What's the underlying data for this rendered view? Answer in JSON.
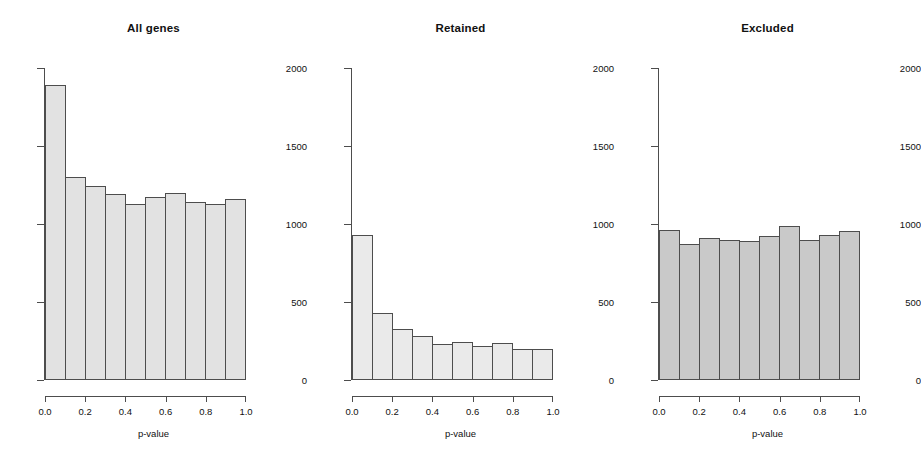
{
  "figure": {
    "background_color": "#ffffff",
    "panel_count": 3,
    "axis_color": "#4d4d4d",
    "text_color": "#111111"
  },
  "chart_data": [
    {
      "type": "bar",
      "title": "All genes",
      "xlabel": "p-value",
      "ylabel": "",
      "xlim": [
        0.0,
        1.0
      ],
      "ylim": [
        0,
        2000
      ],
      "grid": false,
      "legend": "none",
      "bin_width": 0.1,
      "bin_edges": [
        0.0,
        0.1,
        0.2,
        0.3,
        0.4,
        0.5,
        0.6,
        0.7,
        0.8,
        0.9,
        1.0
      ],
      "categories": [
        "0.0-0.1",
        "0.1-0.2",
        "0.2-0.3",
        "0.3-0.4",
        "0.4-0.5",
        "0.5-0.6",
        "0.6-0.7",
        "0.7-0.8",
        "0.8-0.9",
        "0.9-1.0"
      ],
      "values": [
        1890,
        1300,
        1245,
        1190,
        1130,
        1170,
        1200,
        1140,
        1130,
        1160
      ],
      "xticks": [
        "0.0",
        "0.2",
        "0.4",
        "0.6",
        "0.8",
        "1.0"
      ],
      "xtick_values": [
        0.0,
        0.2,
        0.4,
        0.6,
        0.8,
        1.0
      ],
      "yticks": [
        "0",
        "500",
        "1000",
        "1500",
        "2000"
      ],
      "ytick_values": [
        0,
        500,
        1000,
        1500,
        2000
      ],
      "bar_fill": "#e2e2e2",
      "bar_edge": "#4d4d4d"
    },
    {
      "type": "bar",
      "title": "Retained",
      "xlabel": "p-value",
      "ylabel": "",
      "xlim": [
        0.0,
        1.0
      ],
      "ylim": [
        0,
        2000
      ],
      "grid": false,
      "legend": "none",
      "bin_width": 0.1,
      "bin_edges": [
        0.0,
        0.1,
        0.2,
        0.3,
        0.4,
        0.5,
        0.6,
        0.7,
        0.8,
        0.9,
        1.0
      ],
      "categories": [
        "0.0-0.1",
        "0.1-0.2",
        "0.2-0.3",
        "0.3-0.4",
        "0.4-0.5",
        "0.5-0.6",
        "0.6-0.7",
        "0.7-0.8",
        "0.8-0.9",
        "0.9-1.0"
      ],
      "values": [
        930,
        430,
        330,
        285,
        230,
        245,
        215,
        240,
        200,
        200
      ],
      "xticks": [
        "0.0",
        "0.2",
        "0.4",
        "0.6",
        "0.8",
        "1.0"
      ],
      "xtick_values": [
        0.0,
        0.2,
        0.4,
        0.6,
        0.8,
        1.0
      ],
      "yticks": [
        "0",
        "500",
        "1000",
        "1500",
        "2000"
      ],
      "ytick_values": [
        0,
        500,
        1000,
        1500,
        2000
      ],
      "bar_fill": "#eaeaea",
      "bar_edge": "#4d4d4d"
    },
    {
      "type": "bar",
      "title": "Excluded",
      "xlabel": "p-value",
      "ylabel": "",
      "xlim": [
        0.0,
        1.0
      ],
      "ylim": [
        0,
        2000
      ],
      "grid": false,
      "legend": "none",
      "bin_width": 0.1,
      "bin_edges": [
        0.0,
        0.1,
        0.2,
        0.3,
        0.4,
        0.5,
        0.6,
        0.7,
        0.8,
        0.9,
        1.0
      ],
      "categories": [
        "0.0-0.1",
        "0.1-0.2",
        "0.2-0.3",
        "0.3-0.4",
        "0.4-0.5",
        "0.5-0.6",
        "0.6-0.7",
        "0.7-0.8",
        "0.8-0.9",
        "0.9-1.0"
      ],
      "values": [
        960,
        875,
        910,
        895,
        890,
        925,
        985,
        900,
        930,
        955
      ],
      "xticks": [
        "0.0",
        "0.2",
        "0.4",
        "0.6",
        "0.8",
        "1.0"
      ],
      "xtick_values": [
        0.0,
        0.2,
        0.4,
        0.6,
        0.8,
        1.0
      ],
      "yticks": [
        "0",
        "500",
        "1000",
        "1500",
        "2000"
      ],
      "ytick_values": [
        0,
        500,
        1000,
        1500,
        2000
      ],
      "bar_fill": "#c9c9c9",
      "bar_edge": "#4d4d4d"
    }
  ]
}
